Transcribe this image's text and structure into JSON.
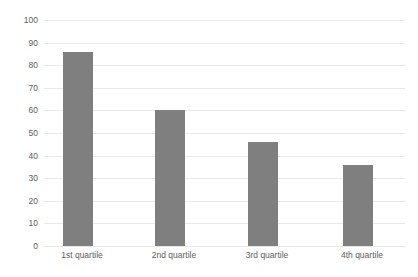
{
  "chart_data": {
    "type": "bar",
    "title": "",
    "subtitle": "",
    "xlabel": "",
    "ylabel": "",
    "categories": [
      "1st quartile",
      "2nd quartile",
      "3rd quartile",
      "4th quartile"
    ],
    "values": [
      86,
      60,
      46,
      36
    ],
    "ylim": [
      0,
      100
    ],
    "ytick_labels": [
      "100",
      "90",
      "80",
      "70",
      "60",
      "50",
      "40",
      "30",
      "20",
      "10",
      "0"
    ],
    "ytick_values": [
      100,
      90,
      80,
      70,
      60,
      50,
      40,
      30,
      20,
      10,
      0
    ],
    "grid": true,
    "grid_axis": "y",
    "legend": false,
    "legend_position": "none",
    "series": [
      {
        "name": "",
        "values": [
          86,
          60,
          46,
          36
        ]
      }
    ],
    "colors": {
      "bar": "#7f7f7f",
      "gridline": "#e8e8e8",
      "text": "#5e5e5e",
      "background": "#ffffff"
    }
  }
}
